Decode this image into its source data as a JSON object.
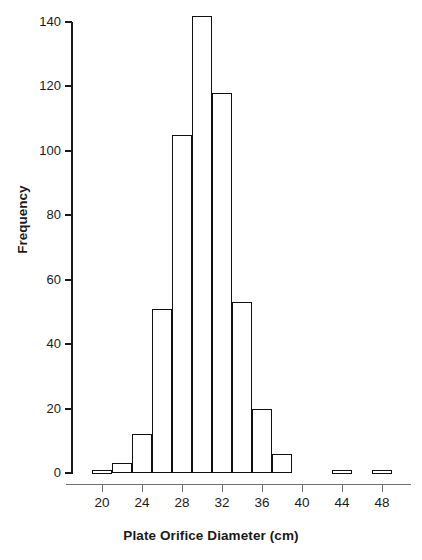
{
  "chart_data": {
    "type": "bar",
    "title": "",
    "xlabel": "Plate Orifice Diameter (cm)",
    "ylabel": "Frequency",
    "xlim": [
      17,
      50
    ],
    "ylim": [
      0,
      140
    ],
    "xticks": [
      20,
      24,
      28,
      32,
      36,
      40,
      44,
      48
    ],
    "yticks": [
      0,
      20,
      40,
      60,
      80,
      100,
      120,
      140
    ],
    "grid": false,
    "legend": null,
    "bin_width": 2,
    "bins": [
      {
        "start": 19,
        "end": 21,
        "value": 1
      },
      {
        "start": 21,
        "end": 23,
        "value": 3
      },
      {
        "start": 23,
        "end": 25,
        "value": 12
      },
      {
        "start": 25,
        "end": 27,
        "value": 51
      },
      {
        "start": 27,
        "end": 29,
        "value": 105
      },
      {
        "start": 29,
        "end": 31,
        "value": 142
      },
      {
        "start": 31,
        "end": 33,
        "value": 118
      },
      {
        "start": 33,
        "end": 35,
        "value": 53
      },
      {
        "start": 35,
        "end": 37,
        "value": 20
      },
      {
        "start": 37,
        "end": 39,
        "value": 6
      },
      {
        "start": 43,
        "end": 45,
        "value": 1
      },
      {
        "start": 47,
        "end": 49,
        "value": 1
      }
    ],
    "categories": [
      "19-21",
      "21-23",
      "23-25",
      "25-27",
      "27-29",
      "29-31",
      "31-33",
      "33-35",
      "35-37",
      "37-39",
      "43-45",
      "47-49"
    ],
    "values": [
      1,
      3,
      12,
      51,
      105,
      142,
      118,
      53,
      20,
      6,
      1,
      1
    ]
  },
  "style": {
    "bar_stroke": "#111111",
    "bar_fill": "#ffffff",
    "axis_color": "#1a1a1a",
    "background": "#ffffff"
  }
}
